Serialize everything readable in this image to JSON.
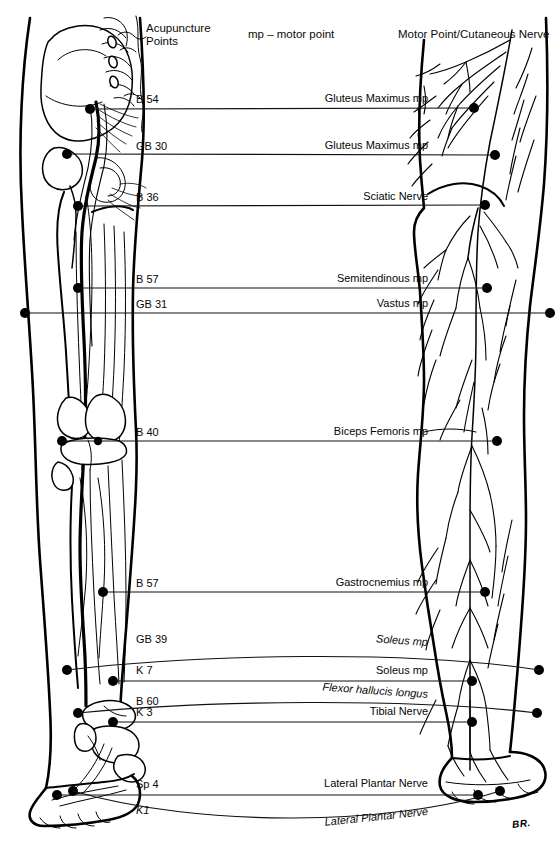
{
  "figure": {
    "signature": "BR.",
    "ink_color": "#000000",
    "background_color": "#ffffff"
  },
  "headers": {
    "left": "Acupuncture\nPoints",
    "center": "mp – motor point",
    "right": "Motor Point/Cutaneous Nerve"
  },
  "rows": [
    {
      "acupuncture_point": "B 54",
      "motor_point": "Gluteus Maximus mp",
      "left_italic": false,
      "right_italic": false
    },
    {
      "acupuncture_point": "GB 30",
      "motor_point": "Gluteus Maximus mp",
      "left_italic": false,
      "right_italic": false
    },
    {
      "acupuncture_point": "B 36",
      "motor_point": "Sciatic Nerve",
      "left_italic": false,
      "right_italic": false
    },
    {
      "acupuncture_point": "B 57",
      "motor_point": "Semitendinous mp",
      "left_italic": false,
      "right_italic": false
    },
    {
      "acupuncture_point": "GB 31",
      "motor_point": "Vastus mp",
      "left_italic": false,
      "right_italic": false
    },
    {
      "acupuncture_point": "B 40",
      "motor_point": "Biceps Femoris mp",
      "left_italic": false,
      "right_italic": false
    },
    {
      "acupuncture_point": "B 57",
      "motor_point": "Gastrocnemius mp",
      "left_italic": false,
      "right_italic": false
    },
    {
      "acupuncture_point": "GB 39",
      "motor_point": "Soleus mp",
      "left_italic": false,
      "right_italic": true
    },
    {
      "acupuncture_point": "K 7",
      "motor_point": "Soleus mp",
      "left_italic": false,
      "right_italic": false
    },
    {
      "acupuncture_point": "B 60",
      "motor_point": "Flexor hallucis longus",
      "left_italic": false,
      "right_italic": true
    },
    {
      "acupuncture_point": "K 3",
      "motor_point": "Tibial Nerve",
      "left_italic": false,
      "right_italic": false
    },
    {
      "acupuncture_point": "Sp 4",
      "motor_point": "Lateral Plantar Nerve",
      "left_italic": false,
      "right_italic": false
    },
    {
      "acupuncture_point": "K1",
      "motor_point": "Lateral Plantar Nerve",
      "left_italic": true,
      "right_italic": true
    }
  ]
}
